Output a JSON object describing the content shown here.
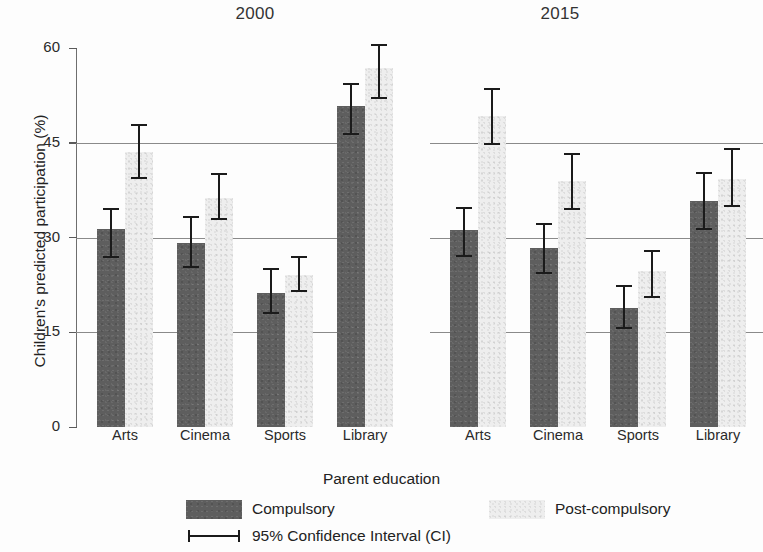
{
  "chart_data": {
    "type": "bar",
    "title": "",
    "xlabel": "Parent education",
    "ylabel": "Children's predicted participation (%)",
    "ylim": [
      0,
      60
    ],
    "yticks": [
      0,
      15,
      30,
      45,
      60
    ],
    "ytick_labels": [
      "0",
      "15",
      "30",
      "45",
      "60"
    ],
    "grid": "horizontal gridlines at 15, 30, 45",
    "legend_position": "bottom",
    "panels": [
      "2000",
      "2015"
    ],
    "categories": [
      "Arts",
      "Cinema",
      "Sports",
      "Library"
    ],
    "series": [
      {
        "name": "Compulsory",
        "color": "#5e5e5e",
        "panels": {
          "2000": {
            "values": [
              31.3,
              29.2,
              21.2,
              50.8
            ],
            "ci_low": [
              26.8,
              25.2,
              17.9,
              46.3
            ],
            "ci_high": [
              34.6,
              33.4,
              25.1,
              54.4
            ]
          },
          "2015": {
            "values": [
              31.2,
              28.4,
              18.8,
              35.8
            ],
            "ci_low": [
              26.9,
              24.3,
              15.5,
              31.2
            ],
            "ci_high": [
              34.9,
              32.3,
              22.5,
              40.4
            ]
          }
        }
      },
      {
        "name": "Post-compulsory",
        "color": "#eeeeee",
        "panels": {
          "2000": {
            "values": [
              43.6,
              36.3,
              24.0,
              56.8
            ],
            "ci_low": [
              39.3,
              32.7,
              21.3,
              51.9
            ],
            "ci_high": [
              48.0,
              40.2,
              27.0,
              60.7
            ]
          },
          "2015": {
            "values": [
              49.3,
              39.0,
              24.7,
              39.3
            ],
            "ci_low": [
              44.7,
              34.4,
              20.5,
              34.8
            ],
            "ci_high": [
              53.7,
              43.4,
              28.1,
              44.1
            ]
          }
        }
      }
    ],
    "error_bar_description": "95% Confidence Interval (CI)"
  },
  "panel_titles": {
    "left": "2000",
    "right": "2015"
  },
  "axes": {
    "y_title": "Children's predicted participation (%)",
    "x_title": "Parent education",
    "y_tick_labels": [
      "60",
      "45",
      "30",
      "15",
      "0"
    ],
    "x_tick_labels_left": [
      "Arts",
      "Cinema",
      "Sports",
      "Library"
    ],
    "x_tick_labels_right": [
      "Arts",
      "Cinema",
      "Sports",
      "Library"
    ]
  },
  "legend": {
    "compulsory_label": "Compulsory",
    "postcompulsory_label": "Post-compulsory",
    "ci_label": "95% Confidence Interval (CI)"
  }
}
